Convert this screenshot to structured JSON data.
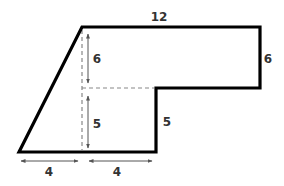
{
  "diagram": {
    "type": "composite-shape",
    "colors": {
      "outline": "#000000",
      "dashed": "#888888",
      "arrow": "#555555",
      "label": "#333333",
      "background": "#ffffff"
    },
    "outline_points": [
      [
        19,
        152
      ],
      [
        82,
        27
      ],
      [
        260,
        27
      ],
      [
        260,
        88
      ],
      [
        156,
        88
      ],
      [
        156,
        152
      ]
    ],
    "dashed_lines": [
      {
        "name": "vertical-dashed-line",
        "from": [
          82,
          27
        ],
        "to": [
          82,
          152
        ]
      },
      {
        "name": "horizontal-dashed-line",
        "from": [
          82,
          88
        ],
        "to": [
          156,
          88
        ]
      }
    ],
    "labels": {
      "top_width": "12",
      "right_height": "6",
      "upper_inner_height": "6",
      "lower_inner_height": "5",
      "step_height": "5",
      "bottom_left_width": "4",
      "bottom_right_width": "4"
    }
  }
}
